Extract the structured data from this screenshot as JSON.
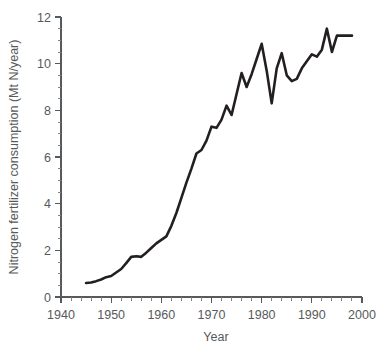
{
  "chart_data": {
    "type": "line",
    "title": "",
    "xlabel": "Year",
    "ylabel": "Nitrogen fertilizer consumption (Mt N/year)",
    "xlim": [
      1940,
      2000
    ],
    "ylim": [
      0,
      12
    ],
    "grid": false,
    "legend": false,
    "x_ticks": [
      1940,
      1950,
      1960,
      1970,
      1980,
      1990,
      2000
    ],
    "x_tick_labels": [
      "1940",
      "1950",
      "1960",
      "1970",
      "1980",
      "1990",
      "2000"
    ],
    "x_minor_step": 2,
    "y_ticks": [
      0,
      2,
      4,
      6,
      8,
      10,
      12
    ],
    "y_tick_labels": [
      "0",
      "2",
      "4",
      "6",
      "8",
      "10",
      "12"
    ],
    "y_minor_step": 0.5,
    "line_color": "#231f20",
    "axis_color": "#58595b",
    "series": [
      {
        "name": "Nitrogen fertilizer consumption",
        "x": [
          1945,
          1946,
          1947,
          1948,
          1949,
          1950,
          1951,
          1952,
          1953,
          1954,
          1955,
          1956,
          1957,
          1958,
          1959,
          1960,
          1961,
          1962,
          1963,
          1964,
          1965,
          1966,
          1967,
          1968,
          1969,
          1970,
          1971,
          1972,
          1973,
          1974,
          1975,
          1976,
          1977,
          1978,
          1979,
          1980,
          1981,
          1982,
          1983,
          1984,
          1985,
          1986,
          1987,
          1988,
          1989,
          1990,
          1991,
          1992,
          1993,
          1994,
          1995,
          1996,
          1997,
          1998
        ],
        "y": [
          0.6,
          0.62,
          0.68,
          0.75,
          0.85,
          0.9,
          1.05,
          1.2,
          1.45,
          1.72,
          1.75,
          1.72,
          1.9,
          2.1,
          2.3,
          2.45,
          2.6,
          3.05,
          3.6,
          4.25,
          4.9,
          5.5,
          6.15,
          6.3,
          6.7,
          7.3,
          7.25,
          7.6,
          8.2,
          7.8,
          8.7,
          9.6,
          9.0,
          9.55,
          10.2,
          10.85,
          9.7,
          8.3,
          9.8,
          10.45,
          9.5,
          9.25,
          9.35,
          9.8,
          10.1,
          10.4,
          10.3,
          10.6,
          11.5,
          10.5,
          11.2,
          11.2,
          11.2,
          11.2
        ]
      }
    ]
  },
  "figure": {
    "x_axis_title": "Year",
    "y_axis_title": "Nitrogen fertilizer consumption (Mt N/year)"
  }
}
